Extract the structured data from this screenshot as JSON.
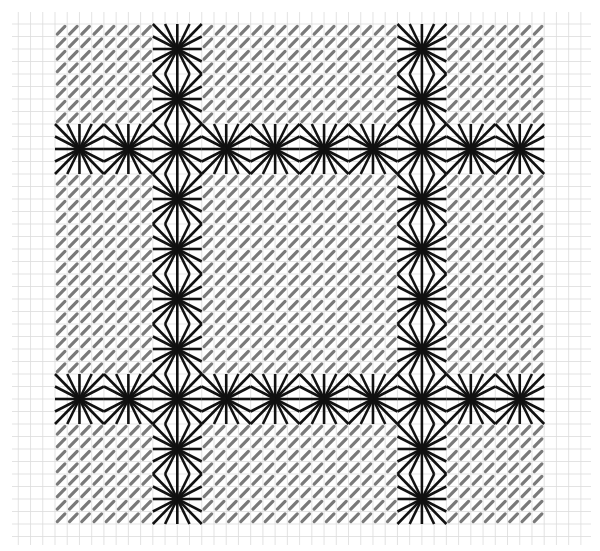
{
  "title": "Stitch pattern chart: star (Smyrna-eyelet) stitch grid over tent-stitch ground",
  "canvas": {
    "width": 600,
    "height": 551,
    "background": "#ffffff"
  },
  "grid": {
    "x0": 12,
    "y0": 12,
    "x1": 591,
    "y1": 545,
    "origin_x": 55,
    "origin_y": 24,
    "cell_w": 12.23,
    "cell_h": 12.5,
    "color": "#dcdcdc",
    "line_width": 0.8
  },
  "pattern": {
    "cols_cells": 40,
    "rows_cells": 40,
    "block_cells": 4,
    "blocks_x": 10,
    "blocks_y": 10,
    "ground_stitch": {
      "type": "tent-stitch",
      "direction": "lower-left-to-upper-right",
      "color": "#7a7a7a",
      "width": 3.2,
      "length_fraction": 0.62
    },
    "star_stitch": {
      "type": "star-eyelet",
      "spokes": 16,
      "color": "#111111",
      "width": 2.6
    },
    "star_columns": [
      2,
      7
    ],
    "star_rows": [
      2,
      7
    ],
    "legend": {
      "star": "16-spoke star stitch spanning a 4x4 cell block",
      "ground": "diagonal tent stitch filling all remaining cells"
    }
  }
}
